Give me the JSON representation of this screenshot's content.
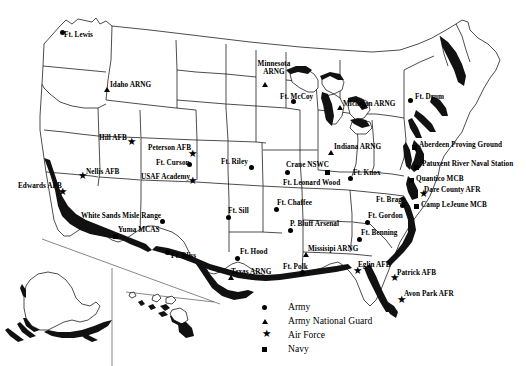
{
  "map": {
    "title": "United States Military Installations Map",
    "background_color": "#ffffff",
    "outline_color": "#000000",
    "coast_shade_color": "#111111"
  },
  "legend": {
    "items": [
      {
        "symbol": "circle",
        "label": "Army"
      },
      {
        "symbol": "triangle",
        "label": "Army National Guard"
      },
      {
        "symbol": "star",
        "label": "Air Force"
      },
      {
        "symbol": "square",
        "label": "Navy"
      }
    ]
  },
  "installations": [
    {
      "name": "Ft. Lewis",
      "branch": "Army",
      "symbol": "circle",
      "label_x": 64,
      "label_y": 31,
      "marker_x": 60,
      "marker_y": 30,
      "align": "left"
    },
    {
      "name": "Idaho ARNG",
      "branch": "Army National Guard",
      "symbol": "triangle",
      "label_x": 110,
      "label_y": 81,
      "marker_x": 104,
      "marker_y": 87,
      "align": "left"
    },
    {
      "name": "Hill AFB",
      "branch": "Air Force",
      "symbol": "star",
      "label_x": 99,
      "label_y": 134,
      "marker_x": 127,
      "marker_y": 138,
      "align": "left"
    },
    {
      "name": "Nellis AFB",
      "branch": "Air Force",
      "symbol": "star",
      "label_x": 86,
      "label_y": 168,
      "marker_x": 78,
      "marker_y": 172,
      "align": "left"
    },
    {
      "name": "Edwards AFB",
      "branch": "Air Force",
      "symbol": "star",
      "label_x": 18,
      "label_y": 182,
      "marker_x": 58,
      "marker_y": 188,
      "align": "left"
    },
    {
      "name": "Peterson AFB",
      "branch": "Air Force",
      "symbol": "star",
      "label_x": 148,
      "label_y": 144,
      "marker_x": 188,
      "marker_y": 150,
      "align": "left"
    },
    {
      "name": "Ft. Curson",
      "branch": "Army",
      "symbol": "circle",
      "label_x": 156,
      "label_y": 159,
      "marker_x": 187,
      "marker_y": 162,
      "align": "left"
    },
    {
      "name": "USAF Academy",
      "branch": "Air Force",
      "symbol": "star",
      "label_x": 141,
      "label_y": 173,
      "marker_x": 188,
      "marker_y": 177,
      "align": "left"
    },
    {
      "name": "White Sands Misle Range",
      "branch": "Army",
      "symbol": "circle",
      "label_x": 81,
      "label_y": 212,
      "marker_x": 160,
      "marker_y": 219,
      "align": "left"
    },
    {
      "name": "Yuma MCAS",
      "branch": "Navy",
      "symbol": "square",
      "label_x": 118,
      "label_y": 226,
      "marker_x": 113,
      "marker_y": 234,
      "align": "left"
    },
    {
      "name": "Ft. Bliss",
      "branch": "Army",
      "symbol": "circle",
      "label_x": 171,
      "label_y": 252,
      "marker_x": 165,
      "marker_y": 250,
      "align": "left"
    },
    {
      "name": "Ft. Riley",
      "branch": "Army",
      "symbol": "circle",
      "label_x": 221,
      "label_y": 158,
      "marker_x": 249,
      "marker_y": 165,
      "align": "left"
    },
    {
      "name": "Ft. Sill",
      "branch": "Army",
      "symbol": "circle",
      "label_x": 228,
      "label_y": 207,
      "marker_x": 226,
      "marker_y": 215,
      "align": "left"
    },
    {
      "name": "Ft. Hood",
      "branch": "Army",
      "symbol": "circle",
      "label_x": 240,
      "label_y": 248,
      "marker_x": 235,
      "marker_y": 256,
      "align": "left"
    },
    {
      "name": "Texas ARNG",
      "branch": "Army National Guard",
      "symbol": "triangle",
      "label_x": 231,
      "label_y": 268,
      "marker_x": 228,
      "marker_y": 275,
      "align": "left"
    },
    {
      "name": "Minnesota ARNG",
      "branch": "Army National Guard",
      "symbol": "triangle",
      "label_x": 251,
      "label_y": 60,
      "marker_x": 262,
      "marker_y": 82,
      "align": "center",
      "two_line": true,
      "line1": "Minnesota",
      "line2": "ARNG"
    },
    {
      "name": "Ft. McCoy",
      "branch": "Army",
      "symbol": "circle",
      "label_x": 280,
      "label_y": 93,
      "marker_x": 291,
      "marker_y": 99,
      "align": "left"
    },
    {
      "name": "Michigan ARNG",
      "branch": "Army National Guard",
      "symbol": "triangle",
      "label_x": 343,
      "label_y": 100,
      "marker_x": 337,
      "marker_y": 105,
      "align": "left"
    },
    {
      "name": "Ft. Drum",
      "branch": "Army",
      "symbol": "circle",
      "label_x": 415,
      "label_y": 93,
      "marker_x": 408,
      "marker_y": 98,
      "align": "left"
    },
    {
      "name": "Indiana ARNG",
      "branch": "Army National Guard",
      "symbol": "triangle",
      "label_x": 334,
      "label_y": 143,
      "marker_x": 328,
      "marker_y": 150,
      "align": "left"
    },
    {
      "name": "Crane NSWC",
      "branch": "Navy",
      "symbol": "square",
      "label_x": 286,
      "label_y": 161,
      "marker_x": 325,
      "marker_y": 170,
      "align": "left"
    },
    {
      "name": "Ft. Knox",
      "branch": "Army",
      "symbol": "circle",
      "label_x": 353,
      "label_y": 169,
      "marker_x": 348,
      "marker_y": 176,
      "align": "left"
    },
    {
      "name": "Ft. Leonard Wood",
      "branch": "Army",
      "symbol": "circle",
      "label_x": 283,
      "label_y": 179,
      "marker_x": 285,
      "marker_y": 170,
      "align": "left"
    },
    {
      "name": "Aberdeen Proving Ground",
      "branch": "Navy",
      "symbol": "square",
      "label_x": 419,
      "label_y": 141,
      "marker_x": 412,
      "marker_y": 145,
      "align": "left"
    },
    {
      "name": "Patuxent River Naval Station",
      "branch": "Navy",
      "symbol": "square",
      "label_x": 422,
      "label_y": 160,
      "marker_x": 414,
      "marker_y": 165,
      "align": "left"
    },
    {
      "name": "Quantico MCB",
      "branch": "Navy",
      "symbol": "square",
      "label_x": 416,
      "label_y": 175,
      "marker_x": 409,
      "marker_y": 178,
      "align": "left"
    },
    {
      "name": "Dare County AFR",
      "branch": "Air Force",
      "symbol": "star",
      "label_x": 424,
      "label_y": 186,
      "marker_x": 419,
      "marker_y": 190,
      "align": "left"
    },
    {
      "name": "Camp LeJeune MCB",
      "branch": "Navy",
      "symbol": "square",
      "label_x": 421,
      "label_y": 201,
      "marker_x": 414,
      "marker_y": 204,
      "align": "left"
    },
    {
      "name": "Ft. Bragg",
      "branch": "Army",
      "symbol": "circle",
      "label_x": 376,
      "label_y": 196,
      "marker_x": 400,
      "marker_y": 203,
      "align": "left"
    },
    {
      "name": "Ft. Gordon",
      "branch": "Army",
      "symbol": "circle",
      "label_x": 368,
      "label_y": 212,
      "marker_x": 365,
      "marker_y": 220,
      "align": "left"
    },
    {
      "name": "Ft. Benning",
      "branch": "Army",
      "symbol": "circle",
      "label_x": 361,
      "label_y": 229,
      "marker_x": 357,
      "marker_y": 237,
      "align": "left"
    },
    {
      "name": "Ft. Chaffee",
      "branch": "Army",
      "symbol": "circle",
      "label_x": 277,
      "label_y": 199,
      "marker_x": 274,
      "marker_y": 207,
      "align": "left"
    },
    {
      "name": "P. Bluff Arsenal",
      "branch": "Army",
      "symbol": "circle",
      "label_x": 290,
      "label_y": 220,
      "marker_x": 288,
      "marker_y": 228,
      "align": "left"
    },
    {
      "name": "Missisipi ARNG",
      "branch": "Army National Guard",
      "symbol": "triangle",
      "label_x": 308,
      "label_y": 245,
      "marker_x": 303,
      "marker_y": 252,
      "align": "left"
    },
    {
      "name": "Ft. Polk",
      "branch": "Army",
      "symbol": "circle",
      "label_x": 283,
      "label_y": 263,
      "marker_x": 300,
      "marker_y": 270,
      "align": "left"
    },
    {
      "name": "Eglin AFB",
      "branch": "Air Force",
      "symbol": "star",
      "label_x": 358,
      "label_y": 261,
      "marker_x": 353,
      "marker_y": 267,
      "align": "left"
    },
    {
      "name": "Patrick AFB",
      "branch": "Air Force",
      "symbol": "star",
      "label_x": 397,
      "label_y": 269,
      "marker_x": 390,
      "marker_y": 274,
      "align": "left"
    },
    {
      "name": "Avon Park AFR",
      "branch": "Air Force",
      "symbol": "star",
      "label_x": 404,
      "label_y": 290,
      "marker_x": 397,
      "marker_y": 296,
      "align": "left"
    }
  ]
}
